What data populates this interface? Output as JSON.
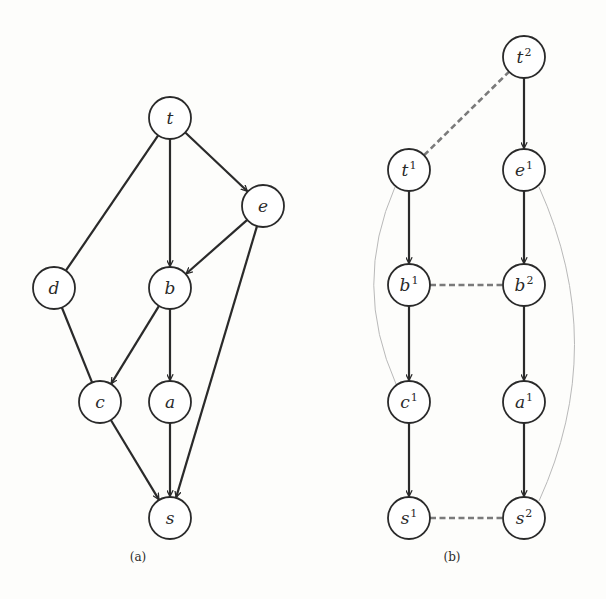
{
  "figure": {
    "panels": [
      {
        "id": "a",
        "caption": "(a)",
        "caption_pos": [
          138,
          561
        ],
        "nodes": [
          {
            "id": "t",
            "label": "t",
            "sup": "",
            "x": 170,
            "y": 118
          },
          {
            "id": "e",
            "label": "e",
            "sup": "",
            "x": 263,
            "y": 206
          },
          {
            "id": "d",
            "label": "d",
            "sup": "",
            "x": 54,
            "y": 288
          },
          {
            "id": "b",
            "label": "b",
            "sup": "",
            "x": 170,
            "y": 288
          },
          {
            "id": "c",
            "label": "c",
            "sup": "",
            "x": 100,
            "y": 402
          },
          {
            "id": "a",
            "label": "a",
            "sup": "",
            "x": 170,
            "y": 402
          },
          {
            "id": "s",
            "label": "s",
            "sup": "",
            "x": 170,
            "y": 518
          }
        ],
        "edges": [
          {
            "from": "t",
            "to": "d",
            "style": "undirected"
          },
          {
            "from": "t",
            "to": "b",
            "style": "arrow"
          },
          {
            "from": "t",
            "to": "e",
            "style": "arrow"
          },
          {
            "from": "e",
            "to": "b",
            "style": "arrow"
          },
          {
            "from": "e",
            "to": "s",
            "style": "arrow"
          },
          {
            "from": "d",
            "to": "c",
            "style": "undirected"
          },
          {
            "from": "b",
            "to": "c",
            "style": "arrow"
          },
          {
            "from": "b",
            "to": "a",
            "style": "arrow"
          },
          {
            "from": "c",
            "to": "s",
            "style": "arrow"
          },
          {
            "from": "a",
            "to": "s",
            "style": "arrow"
          }
        ]
      },
      {
        "id": "b",
        "caption": "(b)",
        "caption_pos": [
          452,
          561
        ],
        "nodes": [
          {
            "id": "t2",
            "label": "t",
            "sup": "2",
            "x": 524,
            "y": 57
          },
          {
            "id": "t1",
            "label": "t",
            "sup": "1",
            "x": 409,
            "y": 170
          },
          {
            "id": "e1",
            "label": "e",
            "sup": "1",
            "x": 524,
            "y": 170
          },
          {
            "id": "b1",
            "label": "b",
            "sup": "1",
            "x": 409,
            "y": 285
          },
          {
            "id": "b2",
            "label": "b",
            "sup": "2",
            "x": 524,
            "y": 285
          },
          {
            "id": "c1",
            "label": "c",
            "sup": "1",
            "x": 409,
            "y": 402
          },
          {
            "id": "a1",
            "label": "a",
            "sup": "1",
            "x": 524,
            "y": 402
          },
          {
            "id": "s1",
            "label": "s",
            "sup": "1",
            "x": 409,
            "y": 518
          },
          {
            "id": "s2",
            "label": "s",
            "sup": "2",
            "x": 524,
            "y": 518
          }
        ],
        "edges": [
          {
            "from": "t2",
            "to": "e1",
            "style": "arrow"
          },
          {
            "from": "t1",
            "to": "b1",
            "style": "arrow"
          },
          {
            "from": "e1",
            "to": "b2",
            "style": "arrow"
          },
          {
            "from": "b1",
            "to": "c1",
            "style": "arrow"
          },
          {
            "from": "b2",
            "to": "a1",
            "style": "arrow"
          },
          {
            "from": "c1",
            "to": "s1",
            "style": "arrow"
          },
          {
            "from": "a1",
            "to": "s2",
            "style": "arrow"
          },
          {
            "from": "t1",
            "to": "t2",
            "style": "dashed"
          },
          {
            "from": "b1",
            "to": "b2",
            "style": "dashed"
          },
          {
            "from": "s1",
            "to": "s2",
            "style": "dashed"
          }
        ],
        "curves": [
          {
            "from": "t1",
            "to": "c1",
            "path": "M 395 187 Q 352 285 396 384"
          },
          {
            "from": "e1",
            "to": "s2",
            "path": "M 539 187 Q 610 345 539 501"
          }
        ]
      }
    ],
    "node_radius": 21,
    "colors": {
      "stroke": "#2a2a2a",
      "dashed": "#7a7a7a",
      "curve": "#b9b9b9",
      "background": "#fdfdfb"
    }
  }
}
